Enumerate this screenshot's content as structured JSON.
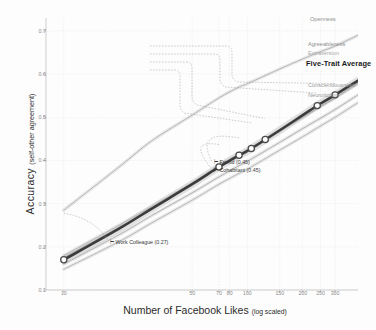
{
  "chart_data": {
    "type": "line",
    "title": "",
    "xlabel": "Number of Facebook Likes",
    "xlabel_sub": "(log scaled)",
    "ylabel": "Accuracy",
    "ylabel_sub": "(self-other agreement)",
    "xscale": "log",
    "xlim": [
      8,
      400
    ],
    "ylim": [
      0.1,
      0.73
    ],
    "grid": true,
    "legend_position": "right-inline",
    "yticks": [
      "0.7",
      "0.6",
      "0.5",
      "0.4",
      "0.3",
      "0.2",
      "0.1"
    ],
    "ytick_values": [
      0.7,
      0.6,
      0.5,
      0.4,
      0.3,
      0.2,
      0.1
    ],
    "xticks": [
      "10",
      "50",
      "70",
      "80",
      "100",
      "150",
      "200",
      "250",
      "300"
    ],
    "xtick_values": [
      10,
      50,
      70,
      80,
      100,
      150,
      200,
      250,
      300
    ],
    "x": [
      10,
      20,
      30,
      50,
      70,
      90,
      100,
      150,
      200,
      250,
      300,
      400
    ],
    "series": [
      {
        "name": "Openness",
        "color": "#a8a8a8",
        "values": [
          0.285,
          0.385,
          0.445,
          0.505,
          0.545,
          0.57,
          0.578,
          0.612,
          0.635,
          0.652,
          0.665,
          0.69
        ]
      },
      {
        "name": "Agreeableness",
        "color": "#9e9e9e",
        "values": [
          0.175,
          0.245,
          0.29,
          0.345,
          0.385,
          0.412,
          0.422,
          0.468,
          0.5,
          0.525,
          0.545,
          0.58
        ]
      },
      {
        "name": "Extraversion",
        "color": "#b0b0b0",
        "values": [
          0.18,
          0.25,
          0.293,
          0.348,
          0.388,
          0.415,
          0.425,
          0.47,
          0.502,
          0.527,
          0.546,
          0.578
        ]
      },
      {
        "name": "Five-Trait Average",
        "color": "#3c3c3c",
        "emphasis": true,
        "values": [
          0.17,
          0.242,
          0.288,
          0.345,
          0.385,
          0.412,
          0.422,
          0.47,
          0.505,
          0.532,
          0.552,
          0.585
        ]
      },
      {
        "name": "Conscientiousness",
        "color": "#a4a4a4",
        "values": [
          0.16,
          0.228,
          0.272,
          0.325,
          0.362,
          0.388,
          0.398,
          0.442,
          0.474,
          0.498,
          0.518,
          0.552
        ]
      },
      {
        "name": "Neuroticism",
        "color": "#acacac",
        "values": [
          0.148,
          0.212,
          0.255,
          0.308,
          0.345,
          0.37,
          0.38,
          0.424,
          0.455,
          0.48,
          0.5,
          0.534
        ]
      }
    ],
    "markers": [
      {
        "label": "Work Colleague",
        "value": 0.27,
        "x": 10
      },
      {
        "label": "Cohabitant",
        "value": 0.45,
        "x": 70
      },
      {
        "label": "Friend",
        "value": 0.45,
        "x": 90
      },
      {
        "label": "Family",
        "value": 0.5,
        "x": 125
      },
      {
        "label": "Humans' Average Accuracy",
        "value": 0.49,
        "x": 105
      },
      {
        "label": "Spouse",
        "value": 0.58,
        "x": 300
      },
      {
        "label": "Computers' Average Accuracy",
        "value": 0.56,
        "x": 240
      }
    ]
  },
  "left_callouts": [
    {
      "text": "Spouse (0.58)",
      "bold": false
    },
    {
      "text": "Computers' Average Accuracy (0.56)",
      "bold": true
    },
    {
      "text": "Family (0.50)",
      "bold": false
    },
    {
      "text": "Humans' Average Accuracy (0.49)",
      "bold": true
    }
  ],
  "right_labels": [
    {
      "text": "Openness",
      "color": "#8f8f8f",
      "big": false
    },
    {
      "text": "Agreeableness",
      "color": "#8f8f8f",
      "big": false
    },
    {
      "text": "Extraversion",
      "color": "#a9a9a9",
      "big": false
    },
    {
      "text": "Five-Trait Average",
      "color": "#1b1b1b",
      "big": true
    },
    {
      "text": "Conscientiousness",
      "color": "#9a9a9a",
      "big": false
    },
    {
      "text": "Neuroticism",
      "color": "#9a9a9a",
      "big": false
    }
  ],
  "inplot_annotations": [
    {
      "text": "Friend (0.45)"
    },
    {
      "text": "Cohabitant (0.45)"
    },
    {
      "text": "Work Colleague (0.27)"
    }
  ],
  "colors": {
    "axis": "#b9b9b9",
    "grid": "#dcdcdc",
    "emphasis_line": "#3c3c3c",
    "band": "#c9c9c9",
    "marker_fill": "#ffffff",
    "marker_stroke": "#4a4a4a",
    "text": "#2b2b2b",
    "tick_text": "#8a8a8a"
  }
}
